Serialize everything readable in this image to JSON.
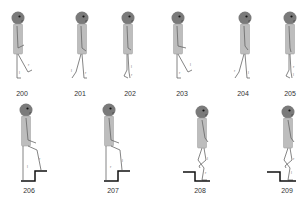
{
  "figure": {
    "colors": {
      "head": "#7a7a7a",
      "eye": "#111111",
      "torso": "#b8b8b8",
      "limb": "#666666",
      "stair": "#111111",
      "label": "#333333"
    },
    "top_row": [
      {
        "label": "200",
        "cx": 22
      },
      {
        "label": "201",
        "cx": 80
      },
      {
        "label": "202",
        "cx": 130
      },
      {
        "label": "203",
        "cx": 182
      },
      {
        "label": "204",
        "cx": 243
      },
      {
        "label": "205",
        "cx": 290
      }
    ],
    "bottom_row": [
      {
        "label": "206",
        "cx": 29
      },
      {
        "label": "207",
        "cx": 113
      },
      {
        "label": "208",
        "cx": 200
      },
      {
        "label": "209",
        "cx": 287
      }
    ],
    "leg_marks": {
      "left": "l",
      "right": "r"
    }
  }
}
